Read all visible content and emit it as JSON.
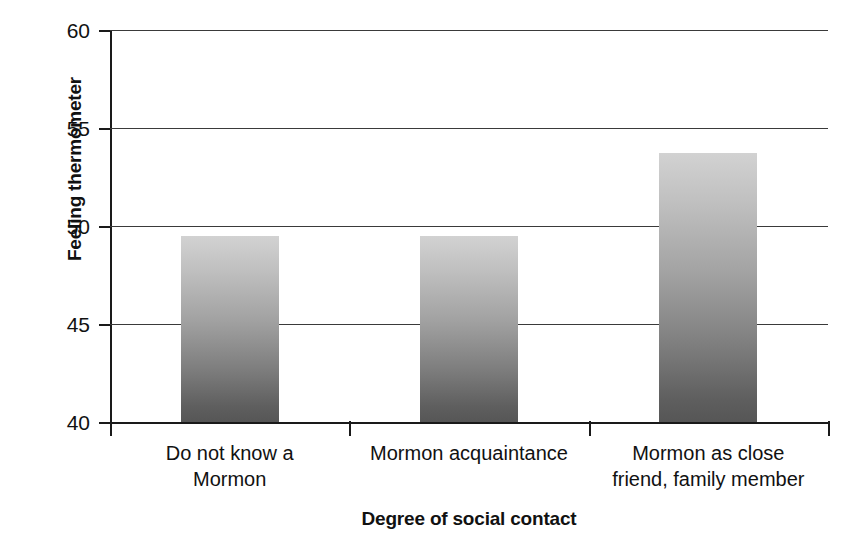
{
  "chart_data": {
    "type": "bar",
    "title": "",
    "xlabel": "Degree of social contact",
    "ylabel": "Feeling thermometer",
    "categories": [
      "Do not know a Mormon",
      "Mormon acquaintance",
      "Mormon as close friend, family member"
    ],
    "category_lines": [
      [
        "Do not know a",
        "Mormon"
      ],
      [
        "Mormon acquaintance",
        ""
      ],
      [
        "Mormon as close",
        "friend, family member"
      ]
    ],
    "values": [
      49.5,
      49.5,
      53.7
    ],
    "ylim": [
      40,
      60
    ],
    "yticks": [
      40,
      45,
      50,
      55,
      60
    ],
    "ytick_labels": [
      "40",
      "45",
      "50",
      "55",
      "60"
    ],
    "grid": true,
    "grid_axis": "y",
    "legend": "none",
    "bar_fill": "#a8a8a8",
    "bar_fill_top": "#d2d2d2",
    "bar_fill_bottom": "#565656",
    "axis_color": "#1a1a1a",
    "background": "#ffffff"
  }
}
